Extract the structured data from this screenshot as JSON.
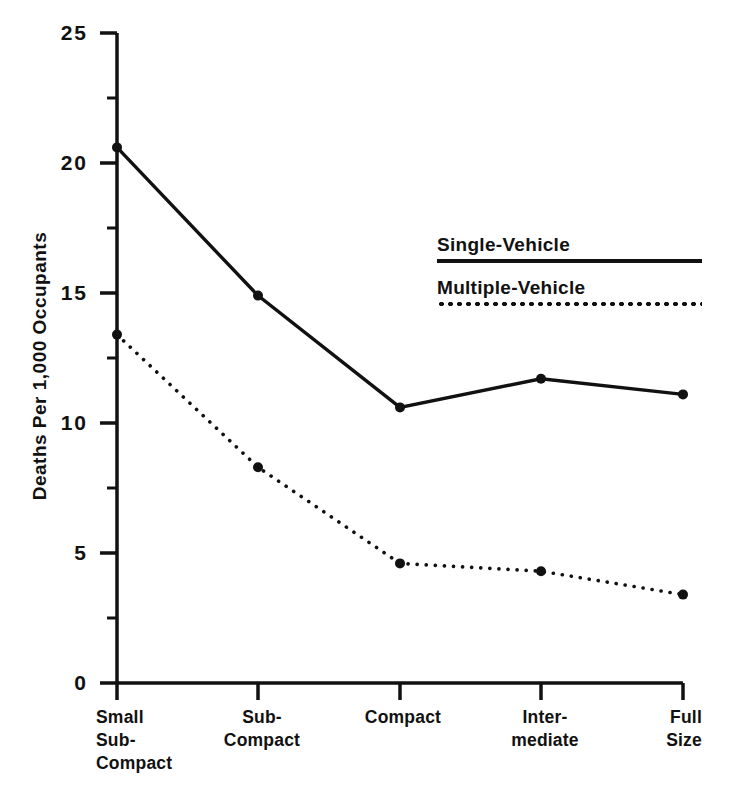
{
  "chart_data": {
    "type": "line",
    "title": "",
    "xlabel": "",
    "ylabel": "Deaths Per 1,000 Occupants",
    "categories": [
      "Small\nSub-\nCompact",
      "Sub-\nCompact",
      "Compact",
      "Inter-\nmediate",
      "Full\nSize"
    ],
    "ylim": [
      0,
      25
    ],
    "y_ticks": [
      "0",
      "5",
      "10",
      "15",
      "20",
      "25"
    ],
    "y_tick_values": [
      0,
      5,
      10,
      15,
      20,
      25
    ],
    "y_minor_tick_values": [
      2.5,
      7.5,
      12.5,
      17.5,
      22.5
    ],
    "grid": false,
    "legend_position": "upper-right-inside",
    "series": [
      {
        "name": "Single-Vehicle",
        "style": "solid",
        "color": "#111111",
        "values": [
          20.6,
          14.9,
          10.6,
          11.7,
          11.1
        ]
      },
      {
        "name": "Multiple-Vehicle",
        "style": "dotted",
        "color": "#111111",
        "values": [
          13.4,
          8.3,
          4.6,
          4.3,
          3.4
        ]
      }
    ]
  },
  "axes": {
    "y_title": "Deaths Per 1,000 Occupants",
    "y_labels": [
      "25",
      "20",
      "15",
      "10",
      "5",
      "0"
    ],
    "x_labels": [
      "Small\nSub-\nCompact",
      "Sub-\nCompact",
      "Compact",
      "Inter-\nmediate",
      "Full\nSize"
    ]
  },
  "legend": {
    "entries": [
      {
        "label": "Single-Vehicle",
        "style": "solid"
      },
      {
        "label": "Multiple-Vehicle",
        "style": "dotted"
      }
    ]
  },
  "colors": {
    "ink": "#111111",
    "background": "#ffffff"
  }
}
